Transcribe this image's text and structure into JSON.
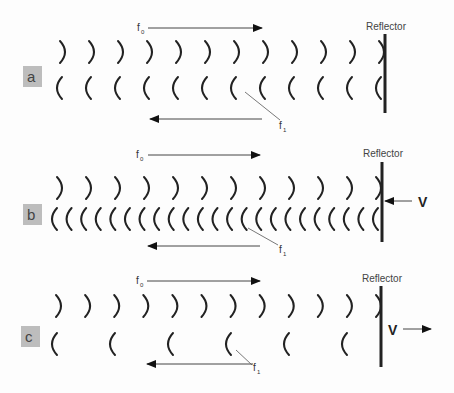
{
  "diagram": {
    "topic": "Doppler shift of waves reflected from a reflector",
    "reflector_label": "Reflector",
    "incident_label": "f0",
    "incident_label_main": "f",
    "incident_label_sub": "0",
    "reflected_label": "f1",
    "reflected_label_main": "f",
    "reflected_label_sub": "1",
    "velocity_label": "V",
    "panels": [
      {
        "id": "a",
        "letter": "a",
        "reflector_motion": "stationary",
        "incident_wavefront_count": 12,
        "reflected_wavefront_count": 12
      },
      {
        "id": "b",
        "letter": "b",
        "reflector_motion": "toward source",
        "velocity_label": "V",
        "incident_wavefront_count": 12,
        "reflected_wavefront_count": 23
      },
      {
        "id": "c",
        "letter": "c",
        "reflector_motion": "away from source",
        "velocity_label": "V",
        "incident_wavefront_count": 12,
        "reflected_wavefront_count": 6
      }
    ],
    "colors": {
      "background": "#fdfdfd",
      "wavefront": "#222222",
      "label_box": "#bdbdbd",
      "text": "#333333"
    }
  }
}
